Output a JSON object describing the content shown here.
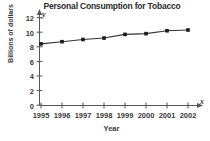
{
  "chart_data": {
    "type": "line",
    "title": "Personal Consumption for Tobacco",
    "xlabel": "Year",
    "ylabel": "Billions of dollars",
    "x_axis_letter": "x",
    "y_axis_letter": "y",
    "categories": [
      "1995",
      "1996",
      "1997",
      "1998",
      "1999",
      "2000",
      "2001",
      "2002"
    ],
    "values": [
      8.4,
      8.7,
      9.0,
      9.2,
      9.7,
      9.8,
      10.2,
      10.3
    ],
    "xlim": [
      1995,
      2002
    ],
    "ylim": [
      0,
      12
    ],
    "yticks": [
      "0",
      "2",
      "4",
      "6",
      "8",
      "10",
      "12"
    ],
    "ytick_values": [
      0,
      2,
      4,
      6,
      8,
      10,
      12
    ],
    "xticks": [
      "1995",
      "1996",
      "1997",
      "1998",
      "1999",
      "2000",
      "2001",
      "2002"
    ],
    "grid": false,
    "legend": null,
    "marker": "square",
    "line_color": "#333333",
    "marker_color": "#1a1a1a",
    "axis_color": "#555555",
    "text_color": "#3a3a3a"
  }
}
